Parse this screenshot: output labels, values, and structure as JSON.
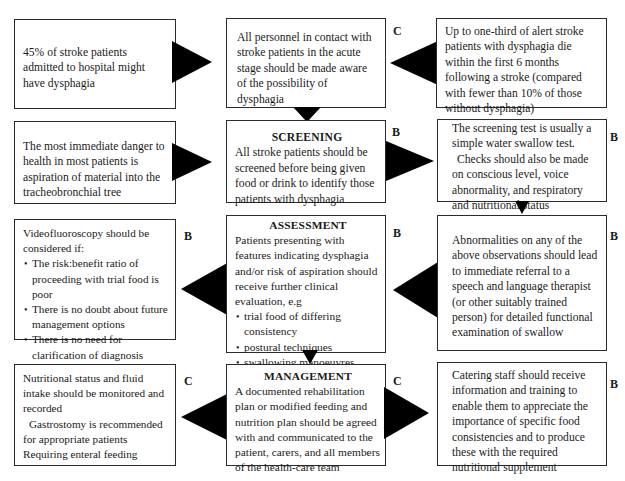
{
  "diagram": {
    "rows": [
      {
        "left": {
          "text": "45% of stroke patients admitted to hospital might have dysphagia"
        },
        "center": {
          "text": "All personnel in contact with stroke patients in the acute stage should be made aware of the possibility of dysphagia",
          "grade": "C"
        },
        "right": {
          "text": "Up to one-third of alert stroke patients with dysphagia die within the first 6 months following a stroke (compared with fewer than 10% of those without dysphagia)"
        }
      },
      {
        "left": {
          "text": "The most immediate danger to health in most patients is aspiration of material into the tracheobronchial tree"
        },
        "center": {
          "title": "SCREENING",
          "text": "All stroke patients should be screened before being given food or drink to identify those patients with dysphagia",
          "grade": "B"
        },
        "right": {
          "text_1": "The screening test is usually a simple water swallow test.",
          "text_2": "Checks should also be made on conscious level, voice abnormality, and respiratory and nutritional status",
          "grade": "B"
        }
      },
      {
        "left": {
          "intro": "Videofluoroscopy should be considered if:",
          "bullets": [
            "The risk:benefit ratio of proceeding with trial food is poor",
            "There is no doubt about future management options",
            "There is no need for clarification of diagnosis"
          ],
          "grade": "B"
        },
        "center": {
          "title": "ASSESSMENT",
          "text": "Patients presenting with features indicating dysphagia and/or risk of aspiration should receive further clinical evaluation, e.g",
          "bullets": [
            "trial food of differing consistency",
            "postural techniques",
            "swallowing manoeuvres",
            "sensory stimulation"
          ],
          "grade": "B"
        },
        "right": {
          "text": "Abnormalities on any of the above observations should lead to immediate referral to a speech and language therapist (or other suitably trained person) for detailed functional examination of swallow",
          "grade": "B"
        }
      },
      {
        "left": {
          "text_1": "Nutritional status and fluid intake should be monitored and recorded",
          "text_2": "Gastrostomy is recommended for appropriate patients Requiring enteral feeding",
          "grade": "C"
        },
        "center": {
          "title": "MANAGEMENT",
          "text": "A documented rehabilitation plan or modified feeding and nutrition plan should be agreed with and communicated to the patient, carers, and all members of the health-care team",
          "grade": "C"
        },
        "right": {
          "text": "Catering staff should receive information and training to enable them to appreciate the importance of specific food consistencies and to produce these with the required nutritional supplement",
          "grade": "B"
        }
      }
    ],
    "arrows": [
      {
        "from": "row1-left",
        "to": "row1-center",
        "direction": "right"
      },
      {
        "from": "row1-right",
        "to": "row1-center",
        "direction": "left"
      },
      {
        "from": "row1-center",
        "to": "row2-center",
        "direction": "down"
      },
      {
        "from": "row2-left",
        "to": "row2-center",
        "direction": "right"
      },
      {
        "from": "row2-center",
        "to": "row2-right",
        "direction": "right"
      },
      {
        "from": "row2-right",
        "to": "row3-right",
        "direction": "down"
      },
      {
        "from": "row3-center",
        "to": "row3-left",
        "direction": "left"
      },
      {
        "from": "row3-right",
        "to": "row3-center",
        "direction": "left"
      },
      {
        "from": "row3-center",
        "to": "row4-center",
        "direction": "down"
      },
      {
        "from": "row4-center",
        "to": "row4-left",
        "direction": "left"
      },
      {
        "from": "row4-center",
        "to": "row4-right",
        "direction": "right"
      }
    ]
  }
}
